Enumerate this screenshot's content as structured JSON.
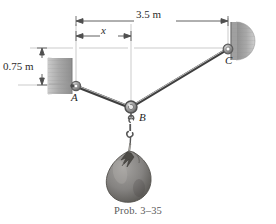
{
  "figure": {
    "caption": "Prob. 3–35",
    "dimensions": {
      "total_span": "3.5 m",
      "partial_span": "x",
      "vertical_offset": "0.75 m"
    },
    "points": {
      "a": "A",
      "b": "B",
      "c": "C"
    },
    "colors": {
      "background": "#ffffff",
      "cable": "#4a4a4a",
      "cable_highlight": "#b8b8b8",
      "wall": "#9c9c9c",
      "wall_dark": "#7a7a7a",
      "ring": "#8a8a8a",
      "sack": "#8e8d8b",
      "sack_dark": "#5f5e5c",
      "dimension_line": "#555555",
      "reference_line": "#b0b0b0",
      "text": "#2b2b2b",
      "caption_text": "#5a5a5a"
    },
    "geometry": {
      "point_a": {
        "x": 76,
        "y": 86
      },
      "point_b": {
        "x": 131,
        "y": 108
      },
      "point_c": {
        "x": 228,
        "y": 49
      },
      "dim_line_total_y": 21,
      "dim_line_partial_y": 36,
      "ref_line_upper_y": 48,
      "ref_line_lower_y": 85,
      "dim_vertical_x": 42,
      "ext_left_x": 76,
      "ext_mid_x": 131,
      "ext_right_x": 228
    }
  }
}
